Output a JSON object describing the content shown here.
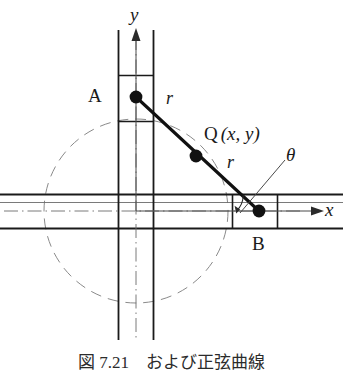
{
  "figure": {
    "kind": "geometry-diagram",
    "background_color": "#ffffff",
    "line_color": "#1a1a1a",
    "thin_line_color": "#6b6b6b",
    "dashed_circle_color": "#8a8a8a",
    "point_color": "#111111"
  },
  "axes": {
    "x_label": "x",
    "y_label": "y",
    "origin_label": ""
  },
  "points": [
    {
      "id": "A",
      "label": "A",
      "label_x": 88,
      "label_y": 86,
      "cx": 136,
      "cy": 97
    },
    {
      "id": "Q",
      "label": "Q",
      "coords_text": "(x, y)",
      "label_x": 204,
      "label_y": 126,
      "cx": 196,
      "cy": 156
    },
    {
      "id": "B",
      "label": "B",
      "label_x": 252,
      "label_y": 234,
      "cx": 259,
      "cy": 211
    }
  ],
  "segments": [
    {
      "id": "A-Q",
      "length_label": "r",
      "label_x": 168,
      "label_y": 96
    },
    {
      "id": "Q-B",
      "length_label": "r",
      "label_x": 229,
      "label_y": 160
    }
  ],
  "angle": {
    "symbol": "θ",
    "label_x": 288,
    "label_y": 153,
    "vertex": "B",
    "measured_from": "x-axis"
  },
  "caption": {
    "text": "図 7.21　および正弦曲線",
    "visible": "clipped"
  }
}
